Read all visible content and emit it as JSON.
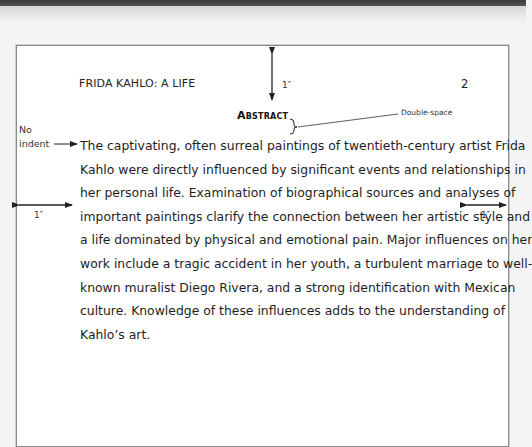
{
  "document": {
    "running_head": "FRIDA KAHLO: A LIFE",
    "page_number": "2",
    "title": "Abstract",
    "body_lines": [
      "The captivating, often surreal paintings of twentieth-century artist Frida",
      "Kahlo were directly influenced by significant events and relationships in",
      "her personal life. Examination of biographical sources and analyses of",
      "important paintings clarify the connection between her artistic style and",
      "a life dominated by physical and emotional pain. Major influences on her",
      "work include a tragic accident in her youth, a turbulent marriage to well-",
      "known muralist Diego Rivera, and a strong identification with Mexican",
      "culture. Knowledge of these influences adds to the understanding of",
      "Kahlo’s art."
    ]
  },
  "annotations": {
    "top_margin": "1″",
    "left_margin": "1″",
    "right_margin": "1″",
    "double_space": "Double-space",
    "no_indent_line1": "No",
    "no_indent_line2": "indent"
  }
}
